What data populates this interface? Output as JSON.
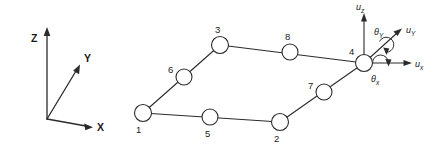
{
  "figure": {
    "line_color": "#2b2b2b",
    "node_fill": "#ffffff",
    "background": "#ffffff"
  },
  "global_axes": {
    "origin_label": "",
    "x": {
      "label": "X"
    },
    "y": {
      "label": "Y"
    },
    "z": {
      "label": "Z"
    }
  },
  "element": {
    "corner_nodes": [
      {
        "id": "1",
        "label": "1"
      },
      {
        "id": "2",
        "label": "2"
      },
      {
        "id": "3",
        "label": "3"
      },
      {
        "id": "4",
        "label": "4"
      }
    ],
    "midside_nodes": [
      {
        "id": "5",
        "label": "5"
      },
      {
        "id": "6",
        "label": "6"
      },
      {
        "id": "7",
        "label": "7"
      },
      {
        "id": "8",
        "label": "8"
      }
    ]
  },
  "dof": {
    "at_node": "4",
    "translations": [
      {
        "symbol": "u",
        "subscript": "z"
      },
      {
        "symbol": "u",
        "subscript": "Y"
      },
      {
        "symbol": "u",
        "subscript": "x"
      }
    ],
    "rotations": [
      {
        "symbol": "θ",
        "subscript": "Y"
      },
      {
        "symbol": "θ",
        "subscript": "x"
      }
    ]
  }
}
